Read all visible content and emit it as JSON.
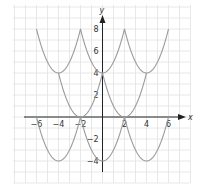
{
  "chart_data": {
    "type": "line",
    "title": "",
    "xlabel": "x",
    "ylabel": "y",
    "xlim": [
      -7.9,
      8.1
    ],
    "ylim": [
      -6,
      10.2
    ],
    "grid": true,
    "legend": null,
    "x_ticks": [
      -6,
      -4,
      -2,
      2,
      4,
      6
    ],
    "y_ticks": [
      -4,
      -2,
      2,
      4,
      6,
      8
    ],
    "series": [
      {
        "name": "upper",
        "description": "y = (||x|-2|-2)^2 + 4",
        "x": [
          -6,
          -5,
          -4,
          -3,
          -2,
          -1,
          0,
          1,
          2,
          3,
          4,
          5,
          6
        ],
        "values": [
          8,
          5,
          4,
          5,
          8,
          5,
          4,
          5,
          8,
          5,
          4,
          5,
          8
        ]
      },
      {
        "name": "middle",
        "description": "y = (|x|-2)^2",
        "x": [
          -4,
          -3,
          -2,
          -1,
          0,
          1,
          2,
          3,
          4
        ],
        "values": [
          4,
          1,
          0,
          1,
          4,
          1,
          0,
          1,
          4
        ]
      },
      {
        "name": "lower",
        "description": "y = (||x|-2|-2)^2 - 4",
        "x": [
          -6,
          -5,
          -4,
          -3,
          -2,
          -1,
          0,
          1,
          2,
          3,
          4,
          5,
          6
        ],
        "values": [
          0,
          -3,
          -4,
          -3,
          0,
          -3,
          -4,
          -3,
          0,
          -3,
          -4,
          -3,
          0
        ]
      }
    ],
    "colors": {
      "curve": "#9a9a9a",
      "axis": "#222222",
      "grid": "#e2e2e2",
      "text": "#333333"
    }
  },
  "axes": {
    "x_label": "x",
    "y_label": "y",
    "x_tick_labels": [
      "−6",
      "−4",
      "−2",
      "2",
      "4",
      "6"
    ],
    "y_tick_labels": [
      "8",
      "6",
      "4",
      "2",
      "−2",
      "−4"
    ]
  }
}
